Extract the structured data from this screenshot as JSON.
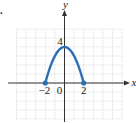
{
  "figure": {
    "part_label": "."
  },
  "chart_data": {
    "type": "line",
    "title": "",
    "xlabel": "x",
    "ylabel": "y",
    "xlim": [
      -5,
      6
    ],
    "ylim": [
      -4,
      6
    ],
    "grid": true,
    "function": "y = 4 - x^2, -2 <= x <= 2",
    "x": [
      -2,
      -1.5,
      -1,
      -0.5,
      0,
      0.5,
      1,
      1.5,
      2
    ],
    "values": [
      0,
      1.75,
      3,
      3.75,
      4,
      3.75,
      3,
      1.75,
      0
    ],
    "endpoints": [
      {
        "x": -2,
        "y": 0,
        "closed": true
      },
      {
        "x": 2,
        "y": 0,
        "closed": true
      }
    ],
    "tick_labels": {
      "x": [
        "-2",
        "0",
        "2"
      ],
      "y": [
        "4"
      ]
    },
    "colors": {
      "curve": "#2c6fb3",
      "grid": "#c8c8c8",
      "axis": "#333333"
    }
  }
}
